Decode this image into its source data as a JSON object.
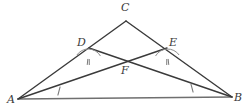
{
  "figure": {
    "type": "geometry-diagram",
    "canvas": {
      "width": 247,
      "height": 110
    },
    "colors": {
      "stroke": "#3a3a3a",
      "base_line": "#6f6f6f",
      "arc": "#8d8d8d",
      "tick": "#7a7a7a",
      "label": "#3a3a3a",
      "background": "#ffffff"
    },
    "points": [
      {
        "id": "A",
        "label": "A",
        "x": 18,
        "y": 99,
        "label_x": 7,
        "label_y": 94
      },
      {
        "id": "B",
        "label": "B",
        "x": 232,
        "y": 97,
        "label_x": 234,
        "label_y": 92
      },
      {
        "id": "C",
        "label": "C",
        "x": 126,
        "y": 21,
        "label_x": 121,
        "label_y": 2
      },
      {
        "id": "D",
        "label": "D",
        "x": 89,
        "y": 48,
        "label_x": 77,
        "label_y": 37
      },
      {
        "id": "E",
        "label": "E",
        "x": 167,
        "y": 48,
        "label_x": 169,
        "label_y": 37
      },
      {
        "id": "F",
        "label": "F",
        "x": 126,
        "y": 62,
        "label_x": 121,
        "label_y": 65
      }
    ],
    "segments": [
      {
        "id": "AC",
        "from": "A",
        "to": "C",
        "note": "left side of triangle through D"
      },
      {
        "id": "CB",
        "from": "C",
        "to": "B",
        "note": "right side of triangle through E"
      },
      {
        "id": "AB",
        "from": "A",
        "to": "B",
        "note": "base of triangle"
      },
      {
        "id": "AE",
        "from": "A",
        "to": "E",
        "note": "cevian from A to E through F"
      },
      {
        "id": "DB",
        "from": "D",
        "to": "B",
        "note": "cevian from D to B through F"
      }
    ],
    "tick_marks": [
      {
        "id": "tick-AF",
        "on_segment": "AE",
        "count": 1,
        "x": 59,
        "y": 91,
        "angle_deg": 105
      },
      {
        "id": "tick-FB",
        "on_segment": "DB",
        "count": 1,
        "x": 192,
        "y": 88,
        "angle_deg": 75
      }
    ],
    "angle_arcs": [
      {
        "id": "angle-D",
        "vertex": "D",
        "ticks": 2,
        "radius": 14,
        "start_deg": 150,
        "end_deg": 35
      },
      {
        "id": "angle-E",
        "vertex": "E",
        "ticks": 2,
        "radius": 14,
        "start_deg": 145,
        "end_deg": 30
      }
    ]
  }
}
